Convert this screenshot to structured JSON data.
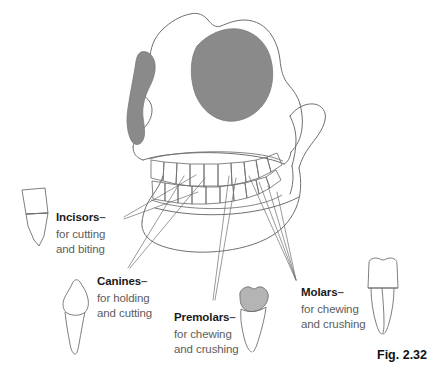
{
  "figure": {
    "caption": "Fig. 2.32",
    "caption_position": {
      "left": 377,
      "top": 348
    },
    "colors": {
      "outline": "#6b6b6b",
      "shade_grey": "#8a8a8a",
      "tooth_shade": "#b4b4b4",
      "heading_text": "#1b1b1b",
      "body_text": "#5d5d5d",
      "background": "#ffffff"
    }
  },
  "labels": [
    {
      "id": "incisors",
      "heading": "Incisors",
      "dash": "–",
      "lines": [
        "for cutting",
        "and biting"
      ],
      "position": {
        "left": 56,
        "top": 206
      }
    },
    {
      "id": "canines",
      "heading": "Canines",
      "dash": "–",
      "lines": [
        "for holding",
        "and cutting"
      ],
      "position": {
        "left": 97,
        "top": 270
      }
    },
    {
      "id": "premolars",
      "heading": "Premolars",
      "dash": "–",
      "lines": [
        "for chewing",
        "and crushing"
      ],
      "position": {
        "left": 174,
        "top": 306
      }
    },
    {
      "id": "molars",
      "heading": "Molars",
      "dash": "–",
      "lines": [
        "for chewing",
        "and crushing"
      ],
      "position": {
        "left": 301,
        "top": 281
      }
    }
  ],
  "specimens": [
    {
      "id": "incisor-tooth",
      "name": "incisor-tooth-illustration",
      "shaded_crown": false
    },
    {
      "id": "canine-tooth",
      "name": "canine-tooth-illustration",
      "shaded_crown": false
    },
    {
      "id": "premolar-tooth",
      "name": "premolar-tooth-illustration",
      "shaded_crown": true
    },
    {
      "id": "molar-tooth",
      "name": "molar-tooth-illustration",
      "shaded_crown": false
    }
  ],
  "anatomy": {
    "skull_label": "skull-outline",
    "mandible_label": "mandible-outline",
    "upper_teeth_label": "upper-tooth-row",
    "lower_teeth_label": "lower-tooth-row",
    "shaded_regions": [
      "temporal-fossa-shading",
      "zygomatic-shading"
    ]
  }
}
